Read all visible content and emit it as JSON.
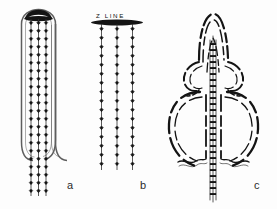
{
  "figure": {
    "kind": "scientific-line-drawing",
    "background_color": "#fdfdfd",
    "ink_color": "#111111",
    "outline_color": "#4a4a4a",
    "panels": [
      {
        "id": "a",
        "letter": "a",
        "description": "Narrow U-shaped loop with dark filled cap at top and three vertical arrow chains extending below",
        "chain_count": 3
      },
      {
        "id": "b",
        "letter": "b",
        "description": "Horizontal dark bar labelled Z LINE with three vertical arrow chains hanging below",
        "chain_count": 3,
        "label": "Z  LINE"
      },
      {
        "id": "c",
        "letter": "c",
        "description": "Lobed bulbous outline with arched apex and a dense banded central chain running through it",
        "chain_count": 3
      }
    ]
  },
  "labels": {
    "z_line": "Z  LINE",
    "panel_a": "a",
    "panel_b": "b",
    "panel_c": "c"
  }
}
